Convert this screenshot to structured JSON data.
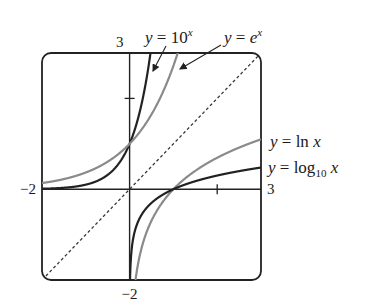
{
  "chart_data": {
    "type": "line",
    "title": "",
    "xlabel": "",
    "ylabel": "",
    "xlim": [
      -2,
      3
    ],
    "ylim": [
      -2,
      3
    ],
    "grid": false,
    "x_tick_values": [
      2
    ],
    "y_tick_values": [
      2
    ],
    "axis_end_labels": {
      "x_min": "−2",
      "x_max": "3",
      "y_min": "−2",
      "y_max": "3"
    },
    "series": [
      {
        "name": "y = 10^x",
        "function": "10^x",
        "color": "#222222",
        "style": "solid",
        "label": {
          "prefix": "y = 10",
          "sup": "x",
          "sub": ""
        }
      },
      {
        "name": "y = e^x",
        "function": "e^x",
        "color": "#8a8a8a",
        "style": "solid",
        "label": {
          "prefix": "y = e",
          "sup": "x",
          "sub": ""
        }
      },
      {
        "name": "y = ln x",
        "function": "ln(x)",
        "color": "#8a8a8a",
        "style": "solid",
        "label": {
          "prefix": "y = ln x",
          "sup": "",
          "sub": ""
        }
      },
      {
        "name": "y = log10 x",
        "function": "log10(x)",
        "color": "#222222",
        "style": "solid",
        "label": {
          "prefix": "y = log",
          "sup": "",
          "sub": "10",
          "suffix": " x"
        }
      },
      {
        "name": "y = x",
        "function": "x",
        "color": "#333333",
        "style": "dashed"
      }
    ],
    "legend": "annotations with arrows (top, right)"
  }
}
